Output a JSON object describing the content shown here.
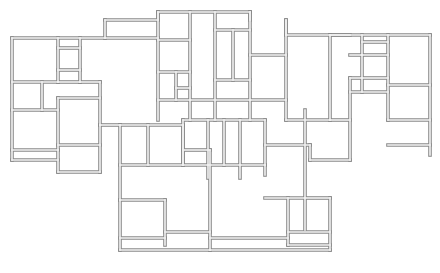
{
  "diagram": {
    "type": "architectural-floor-plan",
    "title": "",
    "wall_color": "#8a8a8a",
    "wall_fill": "#f2f2f2",
    "background": "#ffffff",
    "walls": [
      [
        12,
        38,
        105,
        38
      ],
      [
        105,
        38,
        105,
        20
      ],
      [
        105,
        20,
        158,
        20
      ],
      [
        158,
        20,
        158,
        12
      ],
      [
        158,
        12,
        250,
        12
      ],
      [
        250,
        12,
        250,
        20
      ],
      [
        286,
        20,
        286,
        35
      ],
      [
        286,
        35,
        330,
        35
      ],
      [
        330,
        35,
        430,
        35
      ],
      [
        430,
        35,
        430,
        155
      ],
      [
        12,
        38,
        12,
        160
      ],
      [
        12,
        160,
        58,
        160
      ],
      [
        58,
        150,
        58,
        172
      ],
      [
        58,
        172,
        100,
        172
      ],
      [
        100,
        172,
        100,
        125
      ],
      [
        12,
        82,
        58,
        82
      ],
      [
        58,
        38,
        58,
        82
      ],
      [
        58,
        82,
        80,
        82
      ],
      [
        80,
        38,
        80,
        82
      ],
      [
        58,
        48,
        80,
        48
      ],
      [
        58,
        70,
        80,
        70
      ],
      [
        12,
        110,
        58,
        110
      ],
      [
        42,
        82,
        42,
        110
      ],
      [
        58,
        98,
        100,
        98
      ],
      [
        58,
        98,
        58,
        150
      ],
      [
        12,
        150,
        58,
        150
      ],
      [
        58,
        145,
        100,
        145
      ],
      [
        100,
        82,
        100,
        125
      ],
      [
        80,
        82,
        100,
        82
      ],
      [
        100,
        125,
        120,
        125
      ],
      [
        120,
        125,
        120,
        200
      ],
      [
        120,
        125,
        183,
        125
      ],
      [
        148,
        125,
        148,
        165
      ],
      [
        183,
        125,
        183,
        165
      ],
      [
        120,
        165,
        183,
        165
      ],
      [
        120,
        200,
        165,
        200
      ],
      [
        165,
        200,
        165,
        245
      ],
      [
        120,
        200,
        120,
        250
      ],
      [
        120,
        238,
        165,
        238
      ],
      [
        120,
        250,
        210,
        250
      ],
      [
        165,
        232,
        210,
        232
      ],
      [
        210,
        150,
        210,
        250
      ],
      [
        183,
        150,
        210,
        150
      ],
      [
        105,
        38,
        158,
        38
      ],
      [
        158,
        12,
        158,
        120
      ],
      [
        158,
        40,
        190,
        40
      ],
      [
        158,
        72,
        190,
        72
      ],
      [
        158,
        100,
        190,
        100
      ],
      [
        176,
        72,
        176,
        100
      ],
      [
        176,
        88,
        190,
        88
      ],
      [
        190,
        12,
        190,
        120
      ],
      [
        190,
        100,
        250,
        100
      ],
      [
        215,
        12,
        215,
        120
      ],
      [
        215,
        30,
        250,
        30
      ],
      [
        215,
        80,
        250,
        80
      ],
      [
        233,
        30,
        233,
        80
      ],
      [
        250,
        12,
        250,
        120
      ],
      [
        250,
        55,
        286,
        55
      ],
      [
        250,
        100,
        286,
        100
      ],
      [
        286,
        20,
        286,
        120
      ],
      [
        286,
        120,
        330,
        120
      ],
      [
        330,
        35,
        330,
        120
      ],
      [
        330,
        35,
        350,
        35
      ],
      [
        183,
        120,
        183,
        165
      ],
      [
        183,
        120,
        265,
        120
      ],
      [
        265,
        120,
        265,
        165
      ],
      [
        183,
        165,
        265,
        165
      ],
      [
        208,
        120,
        208,
        165
      ],
      [
        224,
        120,
        224,
        165
      ],
      [
        240,
        120,
        240,
        165
      ],
      [
        208,
        165,
        208,
        178
      ],
      [
        240,
        165,
        240,
        178
      ],
      [
        265,
        145,
        310,
        145
      ],
      [
        305,
        110,
        305,
        230
      ],
      [
        265,
        165,
        265,
        175
      ],
      [
        310,
        145,
        310,
        160
      ],
      [
        310,
        160,
        350,
        160
      ],
      [
        350,
        160,
        350,
        78
      ],
      [
        350,
        78,
        362,
        78
      ],
      [
        350,
        55,
        362,
        55
      ],
      [
        362,
        35,
        362,
        92
      ],
      [
        362,
        42,
        388,
        42
      ],
      [
        362,
        55,
        388,
        55
      ],
      [
        362,
        78,
        388,
        78
      ],
      [
        388,
        35,
        388,
        120
      ],
      [
        388,
        85,
        430,
        85
      ],
      [
        388,
        120,
        430,
        120
      ],
      [
        388,
        145,
        430,
        145
      ],
      [
        330,
        120,
        350,
        120
      ],
      [
        350,
        92,
        388,
        92
      ],
      [
        265,
        198,
        305,
        198
      ],
      [
        288,
        198,
        288,
        245
      ],
      [
        288,
        245,
        330,
        245
      ],
      [
        330,
        198,
        330,
        250
      ],
      [
        288,
        232,
        330,
        232
      ],
      [
        210,
        250,
        330,
        250
      ],
      [
        305,
        198,
        330,
        198
      ],
      [
        210,
        238,
        288,
        238
      ]
    ]
  }
}
